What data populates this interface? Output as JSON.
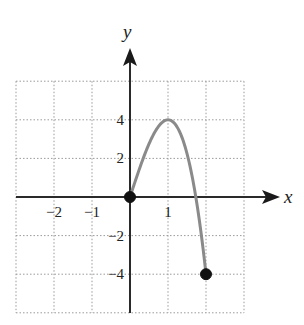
{
  "chart_data": {
    "type": "line",
    "title": "",
    "xlabel": "x",
    "ylabel": "y",
    "xlim": [
      -3,
      3
    ],
    "ylim": [
      -6,
      6
    ],
    "grid": true,
    "grid_style": "dotted",
    "x_ticks": [
      -2,
      -1,
      1
    ],
    "x_tick_labels": [
      "−2",
      "−1",
      "1"
    ],
    "y_ticks": [
      4,
      2,
      -2,
      -4
    ],
    "y_tick_labels": [
      "4",
      "2",
      "−2",
      "−4"
    ],
    "series": [
      {
        "name": "f(x) = -2x^3 + 6x",
        "domain": [
          0,
          2
        ],
        "x": [
          0,
          0.25,
          0.5,
          0.75,
          1,
          1.25,
          1.5,
          1.75,
          2
        ],
        "y": [
          0,
          1.47,
          2.75,
          3.66,
          4,
          3.59,
          2.25,
          -0.22,
          -4
        ],
        "color": "#8a8a8a"
      }
    ],
    "points": [
      {
        "x": 0,
        "y": 0,
        "filled": true
      },
      {
        "x": 2,
        "y": -4,
        "filled": true
      }
    ],
    "legend": null
  },
  "colors": {
    "axis": "#2a2a2a",
    "grid": "#9a9a9a",
    "curve": "#8a8a8a",
    "point": "#111111"
  }
}
